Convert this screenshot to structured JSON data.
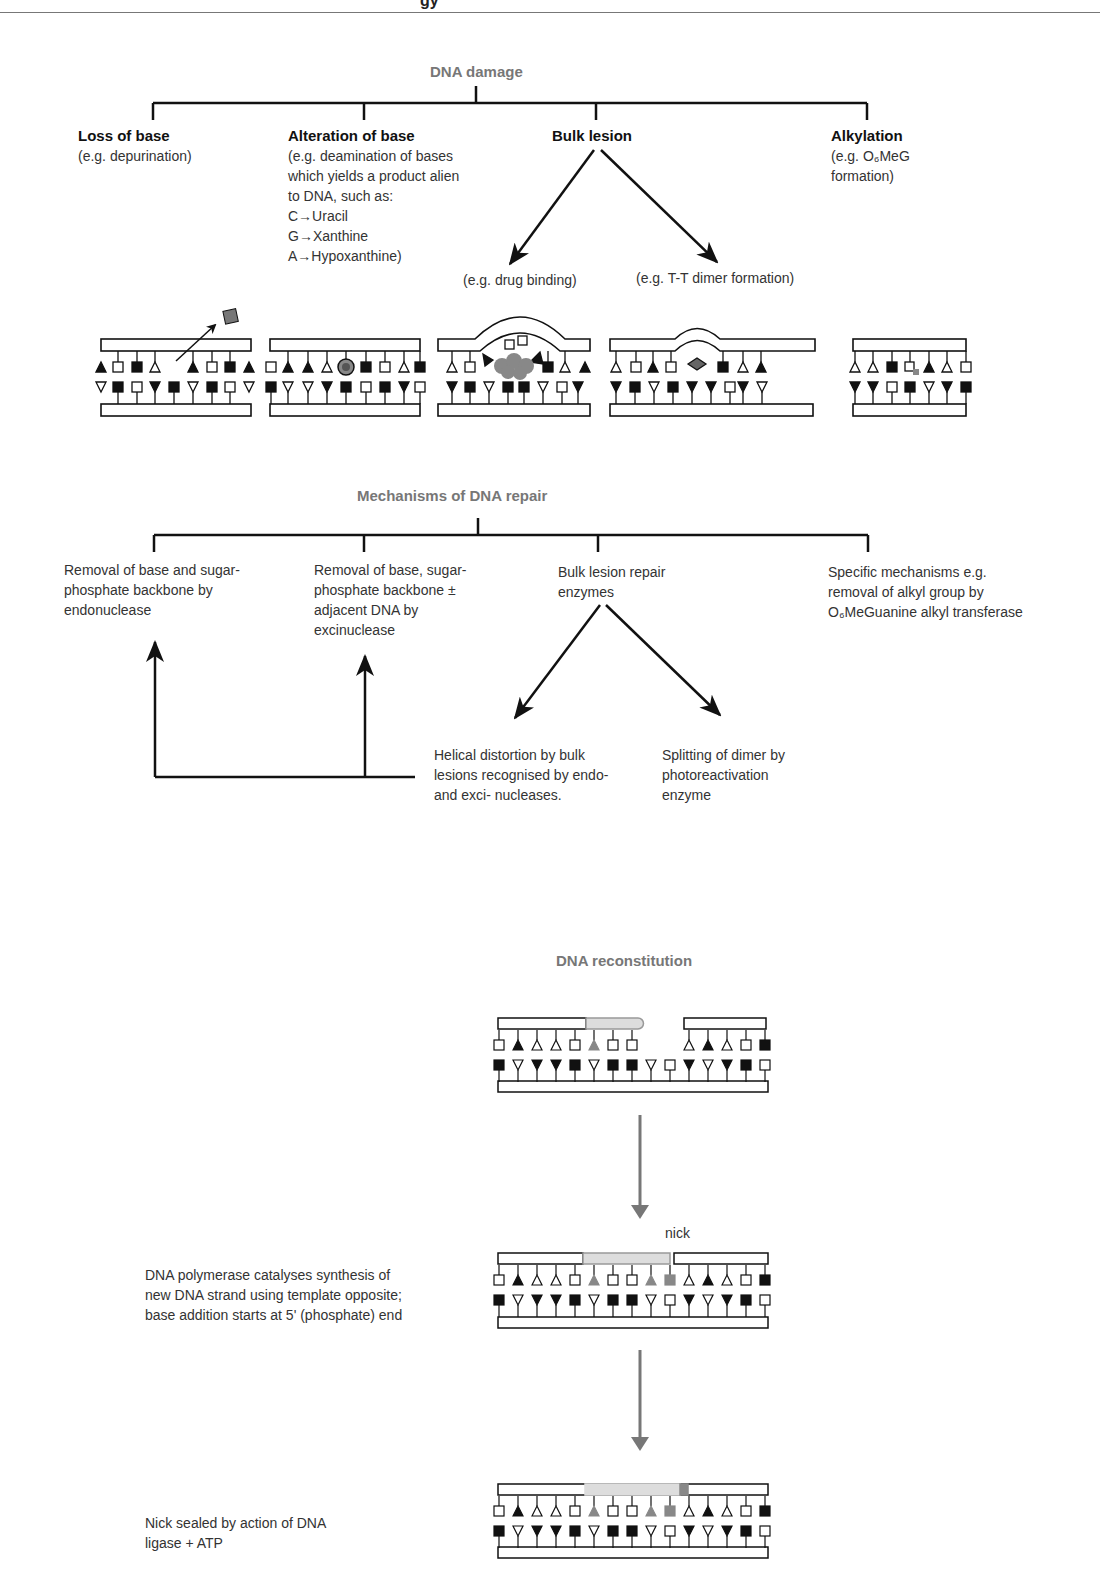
{
  "page": {
    "header_fragment": "gy"
  },
  "damage": {
    "title": "DNA damage",
    "categories": [
      {
        "title": "Loss of base",
        "desc": "(e.g. depurination)"
      },
      {
        "title": "Alteration of base",
        "desc": "(e.g. deamination of bases\nwhich yields a product alien\nto DNA, such as:\nC→Uracil\nG→Xanthine\nA→Hypoxanthine)"
      },
      {
        "title": "Bulk lesion",
        "desc": ""
      },
      {
        "title": "Alkylation",
        "desc": "(e.g. O₆MeG\nformation)"
      }
    ],
    "bulk_examples": [
      "(e.g. drug binding)",
      "(e.g. T-T dimer formation)"
    ]
  },
  "repair": {
    "title": "Mechanisms of DNA repair",
    "items": [
      {
        "text": "Removal of base and sugar-\nphosphate backbone by\nendonuclease"
      },
      {
        "text": "Removal of base, sugar-\nphosphate backbone ±\nadjacent DNA by\nexcinuclease"
      },
      {
        "text": "Bulk lesion repair\nenzymes"
      },
      {
        "text": "Specific mechanisms e.g.\nremoval of alkyl group by\nO₆MeGuanine alkyl transferase"
      }
    ],
    "bulk_outcomes": [
      "Helical distortion by bulk\nlesions recognised by  endo-\nand exci- nucleases.",
      "Splitting of dimer by\nphotoreactivation\nenzyme"
    ]
  },
  "reconstitution": {
    "title": "DNA reconstitution",
    "nick_label": "nick",
    "step2_caption": "DNA polymerase catalyses synthesis of\nnew DNA strand using template opposite;\nbase addition starts at 5' (phosphate) end",
    "step3_caption": "Nick sealed by action of DNA\nligase + ATP"
  },
  "colors": {
    "title_gray": "#777777",
    "line": "#111111",
    "new_base": "#808080",
    "new_strand": "#dddddd"
  }
}
